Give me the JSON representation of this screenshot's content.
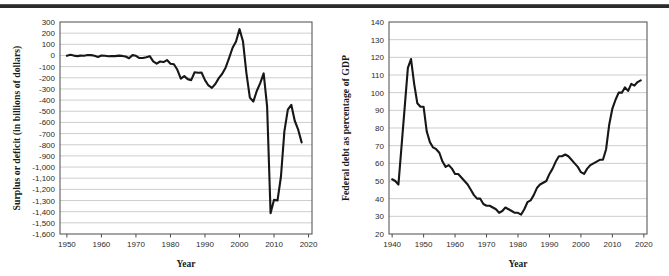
{
  "page": {
    "background_color": "#ffffff",
    "line_color": "#171717",
    "grid_color": "#b9b9b9",
    "frame_color": "#4a4a4a"
  },
  "chart_data": [
    {
      "id": "federal-surplus-deficit",
      "type": "line",
      "title": "",
      "xlabel": "Year",
      "ylabel": "Surplus or deficit (in billions of dollars)",
      "xlim": [
        1948,
        2021
      ],
      "ylim": [
        -1600,
        300
      ],
      "ytick_step": 100,
      "xtick_step": 10,
      "grid": true,
      "legend": "none",
      "xticks": [
        1950,
        1960,
        1970,
        1980,
        1990,
        2000,
        2010,
        2020
      ],
      "xtick_labels": [
        "1950",
        "1960",
        "1970",
        "1980",
        "1990",
        "2000",
        "2010",
        "2020"
      ],
      "yticks": [
        300,
        200,
        100,
        0,
        -100,
        -200,
        -300,
        -400,
        -500,
        -600,
        -700,
        -800,
        -900,
        -1000,
        -1100,
        -1200,
        -1300,
        -1400,
        -1500,
        -1600
      ],
      "ytick_labels": [
        "300",
        "200",
        "100",
        "0",
        "-100",
        "-200",
        "-300",
        "-400",
        "-500",
        "-600",
        "-700",
        "-800",
        "-900",
        "-1,000",
        "-1,100",
        "-1,200",
        "-1,300",
        "-1,400",
        "-1,500",
        "-1,600"
      ],
      "series": [
        {
          "name": "Surplus or deficit",
          "x": [
            1950,
            1951,
            1952,
            1953,
            1954,
            1955,
            1956,
            1957,
            1958,
            1959,
            1960,
            1961,
            1962,
            1963,
            1964,
            1965,
            1966,
            1967,
            1968,
            1969,
            1970,
            1971,
            1972,
            1973,
            1974,
            1975,
            1976,
            1977,
            1978,
            1979,
            1980,
            1981,
            1982,
            1983,
            1984,
            1985,
            1986,
            1987,
            1988,
            1989,
            1990,
            1991,
            1992,
            1993,
            1994,
            1995,
            1996,
            1997,
            1998,
            1999,
            2000,
            2001,
            2002,
            2003,
            2004,
            2005,
            2006,
            2007,
            2008,
            2009,
            2010,
            2011,
            2012,
            2013,
            2014,
            2015,
            2016,
            2017,
            2018
          ],
          "values": [
            -3,
            6,
            -1,
            -6,
            -1,
            -3,
            4,
            3,
            -3,
            -13,
            0,
            -3,
            -7,
            -5,
            -6,
            -1,
            -4,
            -9,
            -25,
            3,
            -3,
            -23,
            -23,
            -15,
            -6,
            -53,
            -74,
            -54,
            -59,
            -41,
            -74,
            -79,
            -128,
            -208,
            -185,
            -212,
            -221,
            -150,
            -155,
            -153,
            -221,
            -269,
            -290,
            -255,
            -203,
            -164,
            -107,
            -22,
            69,
            126,
            236,
            128,
            -158,
            -378,
            -413,
            -318,
            -248,
            -161,
            -459,
            -1413,
            -1294,
            -1300,
            -1087,
            -680,
            -485,
            -442,
            -585,
            -665,
            -779
          ]
        }
      ]
    },
    {
      "id": "federal-debt-percent-gdp",
      "type": "line",
      "title": "",
      "xlabel": "Year",
      "ylabel": "Federal debt as percentage of GDP",
      "xlim": [
        1939,
        2021
      ],
      "ylim": [
        20,
        140
      ],
      "ytick_step": 10,
      "xtick_step": 10,
      "grid": true,
      "legend": "none",
      "xticks": [
        1940,
        1950,
        1960,
        1970,
        1980,
        1990,
        2000,
        2010,
        2020
      ],
      "xtick_labels": [
        "1940",
        "1950",
        "1960",
        "1970",
        "1980",
        "1990",
        "2000",
        "2010",
        "2020"
      ],
      "yticks": [
        140,
        130,
        120,
        110,
        100,
        90,
        80,
        70,
        60,
        50,
        40,
        30,
        20
      ],
      "ytick_labels": [
        "140",
        "130",
        "120",
        "110",
        "100",
        "90",
        "80",
        "70",
        "60",
        "50",
        "40",
        "30",
        "20"
      ],
      "series": [
        {
          "name": "Federal debt as percentage of GDP",
          "x": [
            1940,
            1941,
            1942,
            1943,
            1944,
            1945,
            1946,
            1947,
            1948,
            1949,
            1950,
            1951,
            1952,
            1953,
            1954,
            1955,
            1956,
            1957,
            1958,
            1959,
            1960,
            1961,
            1962,
            1963,
            1964,
            1965,
            1966,
            1967,
            1968,
            1969,
            1970,
            1971,
            1972,
            1973,
            1974,
            1975,
            1976,
            1977,
            1978,
            1979,
            1980,
            1981,
            1982,
            1983,
            1984,
            1985,
            1986,
            1987,
            1988,
            1989,
            1990,
            1991,
            1992,
            1993,
            1994,
            1995,
            1996,
            1997,
            1998,
            1999,
            2000,
            2001,
            2002,
            2003,
            2004,
            2005,
            2006,
            2007,
            2008,
            2009,
            2010,
            2011,
            2012,
            2013,
            2014,
            2015,
            2016,
            2017,
            2018,
            2019
          ],
          "values": [
            51,
            50,
            48,
            70,
            92,
            114,
            119,
            105,
            94,
            92,
            92,
            78,
            72,
            69,
            68,
            66,
            61,
            58,
            59,
            57,
            54,
            54,
            52,
            50,
            48,
            45,
            42,
            40,
            40,
            37,
            36,
            36,
            35,
            34,
            32,
            33,
            35,
            34,
            33,
            32,
            32,
            31,
            34,
            38,
            39,
            42,
            46,
            48,
            49,
            50,
            54,
            57,
            61,
            64,
            64,
            65,
            64,
            62,
            60,
            58,
            55,
            54,
            57,
            59,
            60,
            61,
            62,
            62,
            68,
            82,
            91,
            96,
            100,
            100,
            103,
            101,
            105,
            104,
            106,
            107
          ]
        }
      ]
    }
  ]
}
